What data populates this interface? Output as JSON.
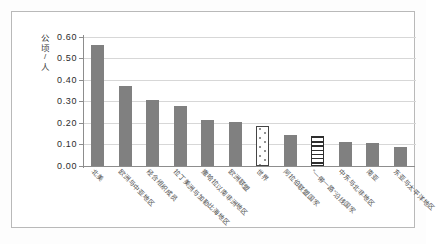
{
  "chart_data": {
    "type": "bar",
    "title": "",
    "subtitle": "",
    "xlabel": "",
    "ylabel": "公顷/人",
    "ylabel_chars": [
      "公",
      "顷",
      "/",
      "人"
    ],
    "ylim": [
      0.0,
      0.6
    ],
    "ytick_labels": [
      "0.60",
      "0.50",
      "0.40",
      "0.30",
      "0.20",
      "0.10",
      "0.00"
    ],
    "ytick_values": [
      0.6,
      0.5,
      0.4,
      0.3,
      0.2,
      0.1,
      0.0
    ],
    "grid": true,
    "legend": "none",
    "categories": [
      "北美",
      "欧洲与中亚地区",
      "经合组织成员",
      "拉丁美洲与加勒比海地区",
      "撒哈拉以南非洲地区",
      "欧洲联盟",
      "世界",
      "阿拉伯联盟国家",
      "“一带一路”沿线国家",
      "中东与北非地区",
      "南亚",
      "东亚与太平洋地区"
    ],
    "values": [
      0.56,
      0.372,
      0.303,
      0.275,
      0.211,
      0.203,
      0.185,
      0.141,
      0.137,
      0.111,
      0.105,
      0.086
    ],
    "bar_styles": [
      "solid",
      "solid",
      "solid",
      "solid",
      "solid",
      "solid",
      "dotted",
      "solid",
      "striped",
      "solid",
      "solid",
      "solid"
    ],
    "colors": {
      "bar_solid": "#808080",
      "bar_dotted_fill": "#ffffff",
      "bar_dotted_border": "#454545",
      "bar_striped_fill": "#ffffff",
      "bar_striped_stripe": "#2e2e2e",
      "gridline": "#d7d7d7",
      "axis": "#8d8d8d",
      "frame": "#b9b9b9",
      "text": "#2b2b2b",
      "background": "#ffffff"
    }
  }
}
